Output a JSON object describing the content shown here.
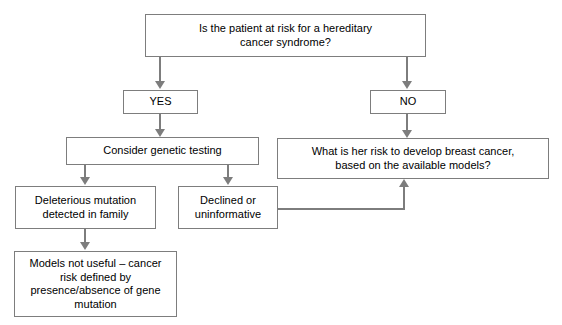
{
  "diagram": {
    "background_color": "#ffffff",
    "border_color": "#7d7d7d",
    "text_color": "#000000",
    "nodes": {
      "root": {
        "text": "Is the patient at risk for a hereditary\ncancer syndrome?"
      },
      "yes": {
        "text": "YES"
      },
      "no": {
        "text": "NO"
      },
      "genetic_testing": {
        "text": "Consider genetic testing"
      },
      "risk_models": {
        "text": "What is her risk to develop breast cancer,\nbased on the available models?"
      },
      "deleterious": {
        "text": "Deleterious mutation\ndetected in family"
      },
      "declined": {
        "text": "Declined or\nuninformative"
      },
      "models_not_useful": {
        "text": "Models not useful – cancer\nrisk defined by\npresence/absence of gene\nmutation"
      }
    },
    "edges": [
      {
        "id": "root-to-yes",
        "from": "root",
        "to": "yes",
        "label": ""
      },
      {
        "id": "root-to-no",
        "from": "root",
        "to": "no",
        "label": ""
      },
      {
        "id": "yes-to-genetic",
        "from": "yes",
        "to": "genetic_testing",
        "label": ""
      },
      {
        "id": "no-to-risk-models",
        "from": "no",
        "to": "risk_models",
        "label": ""
      },
      {
        "id": "genetic-to-deleterious",
        "from": "genetic_testing",
        "to": "deleterious",
        "label": ""
      },
      {
        "id": "genetic-to-declined",
        "from": "genetic_testing",
        "to": "declined",
        "label": ""
      },
      {
        "id": "deleterious-to-models-not-useful",
        "from": "deleterious",
        "to": "models_not_useful",
        "label": ""
      },
      {
        "id": "declined-to-risk-models",
        "from": "declined",
        "to": "risk_models",
        "label": ""
      }
    ]
  }
}
